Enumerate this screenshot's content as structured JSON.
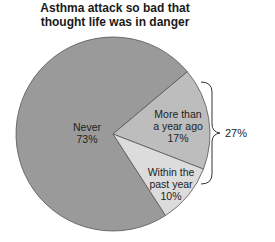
{
  "chart_data": {
    "type": "pie",
    "title": "Asthma attack so bad that thought life was in danger",
    "title_lines": [
      "Asthma attack so bad that",
      "thought life was in danger"
    ],
    "categories": [
      "Never",
      "More than a year ago",
      "Within the past year"
    ],
    "values": [
      73,
      17,
      10
    ],
    "unit": "%",
    "slices": [
      {
        "label_lines": [
          "Never",
          "73%"
        ],
        "value": 73,
        "color": "#9a9a9a"
      },
      {
        "label_lines": [
          "More than",
          "a year ago",
          "17%"
        ],
        "value": 17,
        "color": "#bdbdbd"
      },
      {
        "label_lines": [
          "Within the",
          "past year",
          "10%"
        ],
        "value": 10,
        "color": "#dcdcdc"
      }
    ],
    "annotation": {
      "type": "brace",
      "groups": [
        "More than a year ago",
        "Within the past year"
      ],
      "label": "27%"
    },
    "legend": "none"
  }
}
